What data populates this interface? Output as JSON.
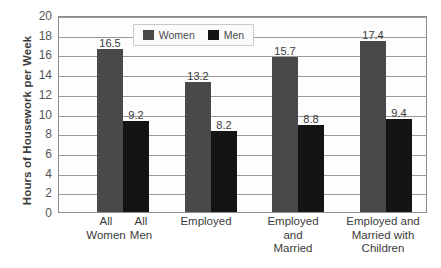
{
  "chart_data": {
    "type": "bar",
    "title": "",
    "subtitle": "",
    "xlabel": "",
    "ylabel": "Hours of Housework per Week",
    "ylim": [
      0,
      20
    ],
    "yticks": [
      0,
      2,
      4,
      6,
      8,
      10,
      12,
      14,
      16,
      18,
      20
    ],
    "ytick_labels": [
      "0",
      "2",
      "4",
      "6",
      "8",
      "10",
      "12",
      "14",
      "16",
      "18",
      "20"
    ],
    "grid": true,
    "grid_axis": "y",
    "legend_position": "top-center-inside",
    "categories": [
      "All\nWomen",
      "Employed",
      "Employed\nand\nMarried",
      "Employed and\nMarried with\nChildren"
    ],
    "category_secondary_labels": [
      "All\nMen",
      "",
      "",
      ""
    ],
    "series": [
      {
        "name": "Women",
        "color": "#494949",
        "values": [
          16.5,
          13.2,
          15.7,
          17.4
        ],
        "value_labels": [
          "16.5",
          "13.2",
          "15.7",
          "17.4"
        ]
      },
      {
        "name": "Men",
        "color": "#141414",
        "values": [
          9.2,
          8.2,
          8.8,
          9.4
        ],
        "value_labels": [
          "9.2",
          "8.2",
          "8.8",
          "9.4"
        ]
      }
    ],
    "annotations": []
  },
  "legend": {
    "items": [
      {
        "label": "Women",
        "color": "#494949"
      },
      {
        "label": "Men",
        "color": "#141414"
      }
    ]
  },
  "axes": {
    "y_title": "Hours of Housework per Week"
  },
  "x_axis_labels": [
    {
      "text": "All\nWomen",
      "center": 48
    },
    {
      "text": "All\nMen",
      "center": 83
    },
    {
      "text": "Employed",
      "center": 148
    },
    {
      "text": "Employed\nand\nMarried",
      "center": 235
    },
    {
      "text": "Employed and\nMarried with\nChildren",
      "center": 325
    }
  ],
  "bars": [
    {
      "series": "Women",
      "group": 0,
      "value": 16.5,
      "label": "16.5",
      "x": 38,
      "w": 26
    },
    {
      "series": "Men",
      "group": 0,
      "value": 9.2,
      "label": "9.2",
      "x": 64,
      "w": 26
    },
    {
      "series": "Women",
      "group": 1,
      "value": 13.2,
      "label": "13.2",
      "x": 126,
      "w": 26
    },
    {
      "series": "Men",
      "group": 1,
      "value": 8.2,
      "label": "8.2",
      "x": 152,
      "w": 26
    },
    {
      "series": "Women",
      "group": 2,
      "value": 15.7,
      "label": "15.7",
      "x": 213,
      "w": 26
    },
    {
      "series": "Men",
      "group": 2,
      "value": 8.8,
      "label": "8.8",
      "x": 239,
      "w": 26
    },
    {
      "series": "Women",
      "group": 3,
      "value": 17.4,
      "label": "17.4",
      "x": 301,
      "w": 26
    },
    {
      "series": "Men",
      "group": 3,
      "value": 9.4,
      "label": "9.4",
      "x": 327,
      "w": 26
    }
  ],
  "colors": {
    "women": "#494949",
    "men": "#141414",
    "grid": "#9a9a9a",
    "axis": "#8c8c8c",
    "text": "#3b3b3b",
    "plot_background": "#fdfdfd",
    "page_background": "#ffffff"
  }
}
